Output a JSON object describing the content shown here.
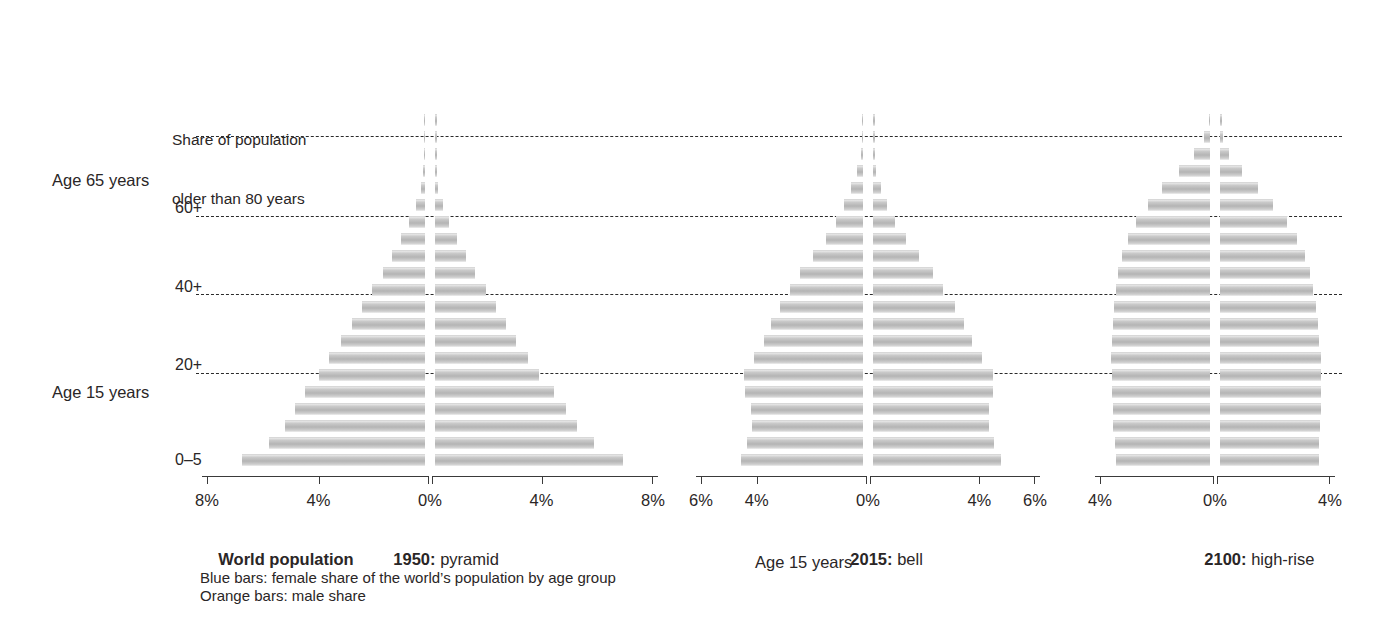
{
  "figure": {
    "side_labels": [
      {
        "text": "Age 65 years",
        "x": 52,
        "y": 170
      },
      {
        "text": "Age 15 years",
        "x": 52,
        "y": 382
      }
    ],
    "note": {
      "line1": "Share of population",
      "line2": "older than 80 years",
      "x": 172,
      "y": 90
    },
    "inner_ticks": [
      {
        "text": "60+",
        "x": 175,
        "y": 198
      },
      {
        "text": "40+",
        "x": 175,
        "y": 277
      },
      {
        "text": "20+",
        "x": 175,
        "y": 355
      },
      {
        "text": "0–5",
        "x": 175,
        "y": 450
      }
    ],
    "gridlines_y": [
      136,
      216,
      294,
      373
    ],
    "captions": [
      {
        "bold": "World population",
        "rest": "",
        "x": 200,
        "y": 528
      },
      {
        "bold": "1950:",
        "rest": " pyramid",
        "x": 375,
        "y": 528
      },
      {
        "bold": "2015:",
        "rest": " bell",
        "x": 832,
        "y": 528
      },
      {
        "bold": "2100:",
        "rest": " high-rise",
        "x": 1186,
        "y": 528
      }
    ],
    "stray_label": {
      "text": "Age 15 years",
      "x": 755,
      "y": 552
    },
    "legend": [
      {
        "text": "Blue bars: female share of the world’s population by age group",
        "x": 200,
        "y": 568
      },
      {
        "text": "Orange bars: male share",
        "x": 200,
        "y": 586
      }
    ],
    "colors": {
      "female_bar": "#7fa8c9",
      "male_bar": "#e8a33d",
      "printed_bar": "#b4b4b4",
      "gridline": "#1a1a1a",
      "axis": "#3a3a3a",
      "text": "#231f20"
    }
  },
  "chart_data": [
    {
      "type": "bar",
      "title": "1950: pyramid",
      "subtitle": "World population",
      "orientation": "horizontal-diverging",
      "xlabel": "Share of population",
      "ylabel": "Age group",
      "xlim": [
        -8,
        8
      ],
      "xticks": [
        -8,
        -4,
        0,
        4,
        8
      ],
      "xticklabels": [
        "8%",
        "4%",
        "0%",
        "4%",
        "8%"
      ],
      "grid": true,
      "legend_position": "below",
      "categories": [
        "0–5",
        "5–10",
        "10–15",
        "15–20",
        "20–25",
        "25–30",
        "30–35",
        "35–40",
        "40–45",
        "45–50",
        "50–55",
        "55–60",
        "60–65",
        "65–70",
        "70–75",
        "75–80",
        "80–85",
        "85–90",
        "90–95",
        "95–100",
        "100+"
      ],
      "series": [
        {
          "name": "Blue bars: female share",
          "values": [
            6.55,
            5.6,
            5.02,
            4.66,
            4.31,
            3.82,
            3.43,
            3.0,
            2.63,
            2.26,
            1.89,
            1.52,
            1.18,
            0.86,
            0.57,
            0.33,
            0.16,
            0.06,
            0.02,
            0.005,
            0.001
          ]
        },
        {
          "name": "Orange bars: male share",
          "values": [
            6.75,
            5.72,
            5.1,
            4.7,
            4.28,
            3.74,
            3.34,
            2.92,
            2.56,
            2.2,
            1.82,
            1.44,
            1.1,
            0.78,
            0.5,
            0.27,
            0.12,
            0.04,
            0.01,
            0.003,
            0.001
          ]
        }
      ]
    },
    {
      "type": "bar",
      "title": "2015: bell",
      "orientation": "horizontal-diverging",
      "xlim": [
        -6,
        6
      ],
      "xticks": [
        -6,
        -4,
        0,
        4,
        6
      ],
      "xticklabels": [
        "6%",
        "4%",
        "0%",
        "4%",
        "6%"
      ],
      "grid": true,
      "categories": [
        "0–5",
        "5–10",
        "10–15",
        "15–20",
        "20–25",
        "25–30",
        "30–35",
        "35–40",
        "40–45",
        "45–50",
        "50–55",
        "55–60",
        "60–65",
        "65–70",
        "70–75",
        "75–80",
        "80–85",
        "85–90",
        "90–95",
        "95–100",
        "100+"
      ],
      "series": [
        {
          "name": "Blue bars: female share",
          "values": [
            4.4,
            4.16,
            4.0,
            4.04,
            4.24,
            4.28,
            3.9,
            3.56,
            3.3,
            3.0,
            2.62,
            2.26,
            1.8,
            1.32,
            0.96,
            0.68,
            0.42,
            0.2,
            0.07,
            0.015,
            0.003
          ]
        },
        {
          "name": "Orange bars: male share",
          "values": [
            4.6,
            4.34,
            4.16,
            4.18,
            4.32,
            4.32,
            3.92,
            3.56,
            3.28,
            2.94,
            2.52,
            2.14,
            1.66,
            1.18,
            0.8,
            0.5,
            0.27,
            0.11,
            0.03,
            0.006,
            0.001
          ]
        }
      ]
    },
    {
      "type": "bar",
      "title": "2100: high-rise",
      "orientation": "horizontal-diverging",
      "xlim": [
        -4,
        4
      ],
      "xticks": [
        -4,
        0,
        4
      ],
      "xticklabels": [
        "4%",
        "0%",
        "4%"
      ],
      "grid": true,
      "categories": [
        "0–5",
        "5–10",
        "10–15",
        "15–20",
        "20–25",
        "25–30",
        "30–35",
        "35–40",
        "40–45",
        "45–50",
        "50–55",
        "55–60",
        "60–65",
        "65–70",
        "70–75",
        "75–80",
        "80–85",
        "85–90",
        "90–95",
        "95–100",
        "100+"
      ],
      "series": [
        {
          "name": "Blue bars: female share",
          "values": [
            3.28,
            3.32,
            3.36,
            3.38,
            3.4,
            3.42,
            3.44,
            3.42,
            3.38,
            3.34,
            3.28,
            3.2,
            3.06,
            2.86,
            2.56,
            2.16,
            1.66,
            1.08,
            0.56,
            0.22,
            0.05
          ]
        },
        {
          "name": "Orange bars: male share",
          "values": [
            3.44,
            3.46,
            3.48,
            3.5,
            3.5,
            3.5,
            3.5,
            3.46,
            3.4,
            3.34,
            3.24,
            3.12,
            2.94,
            2.68,
            2.32,
            1.86,
            1.32,
            0.76,
            0.32,
            0.1,
            0.015
          ]
        }
      ]
    }
  ],
  "layout": {
    "charts": [
      {
        "center_x": 430,
        "half_width": 228,
        "axis_y": 470,
        "top_y": 118
      },
      {
        "center_x": 868,
        "half_width": 172,
        "axis_y": 470,
        "top_y": 72
      },
      {
        "center_x": 1215,
        "half_width": 120,
        "axis_y": 470,
        "top_y": 24
      }
    ],
    "band_height": 17.0,
    "bar_height": 11.0,
    "center_gap": 5
  }
}
